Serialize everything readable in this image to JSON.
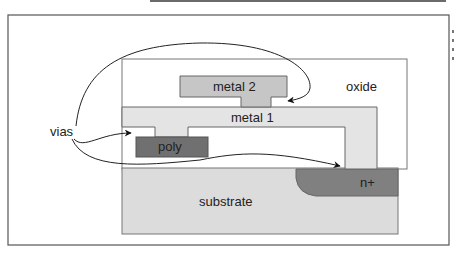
{
  "diagram": {
    "type": "cross-section",
    "labels": {
      "vias": "vias",
      "metal2": "metal 2",
      "metal1": "metal 1",
      "oxide": "oxide",
      "poly": "poly",
      "substrate": "substrate",
      "nplus": "n+"
    },
    "colors": {
      "frame": "#555555",
      "oxide": "#ffffff",
      "metal1": "#e4e4e4",
      "metal2": "#c6c6c6",
      "poly": "#707070",
      "substrate": "#dcdcdc",
      "nplus": "#808080",
      "outline": "#666666",
      "arrow": "#111111"
    },
    "arrows": [
      {
        "from": "vias",
        "to": "metal2-to-metal1 via"
      },
      {
        "from": "vias",
        "to": "metal1-to-poly via"
      },
      {
        "from": "vias",
        "to": "metal1-to-n+ contact"
      }
    ]
  }
}
